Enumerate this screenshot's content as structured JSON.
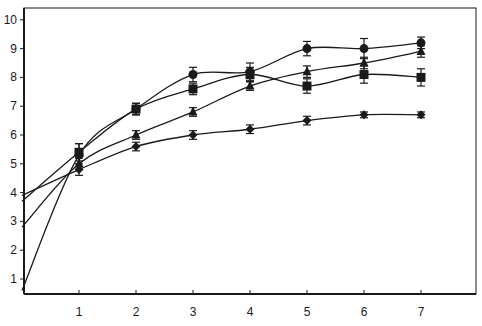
{
  "chart_data": {
    "type": "line",
    "title": "",
    "xlabel": "",
    "ylabel": "",
    "xlim": [
      0,
      8.1
    ],
    "ylim": [
      0.5,
      10.3
    ],
    "x_ticks": [
      "1",
      "2",
      "3",
      "4",
      "5",
      "6",
      "7"
    ],
    "y_ticks": [
      "1",
      "2",
      "3",
      "4",
      "5",
      "6",
      "7",
      "8",
      "9",
      "10"
    ],
    "grid": false,
    "legend": "none",
    "x": [
      1,
      2,
      3,
      4,
      5,
      6,
      7
    ],
    "series": [
      {
        "name": "circle",
        "marker": "circle",
        "values": [
          5.3,
          6.9,
          8.1,
          8.2,
          9.0,
          9.0,
          9.2
        ],
        "errors": [
          0.4,
          0.2,
          0.25,
          0.3,
          0.25,
          0.35,
          0.2
        ],
        "fit_start": 0.6
      },
      {
        "name": "square",
        "marker": "square",
        "values": [
          5.4,
          6.9,
          7.6,
          8.1,
          7.7,
          8.1,
          8.0
        ],
        "errors": [
          0.3,
          0.2,
          0.2,
          0.25,
          0.25,
          0.3,
          0.3
        ],
        "fit_start": 3.7
      },
      {
        "name": "triangle",
        "marker": "triangle",
        "values": [
          5.0,
          6.0,
          6.8,
          7.7,
          8.2,
          8.5,
          8.9
        ],
        "errors": [
          0.2,
          0.15,
          0.15,
          0.15,
          0.2,
          0.2,
          0.2
        ],
        "fit_start": 2.8
      },
      {
        "name": "diamond",
        "marker": "diamond",
        "values": [
          4.8,
          5.6,
          6.0,
          6.2,
          6.5,
          6.7,
          6.7
        ],
        "errors": [
          0.2,
          0.15,
          0.15,
          0.15,
          0.15,
          0.1,
          0.1
        ],
        "fit_start": 3.9
      }
    ]
  },
  "colors": {
    "line": "#1a1a1a",
    "background": "#ffffff",
    "frame": "#1a1a1a"
  }
}
